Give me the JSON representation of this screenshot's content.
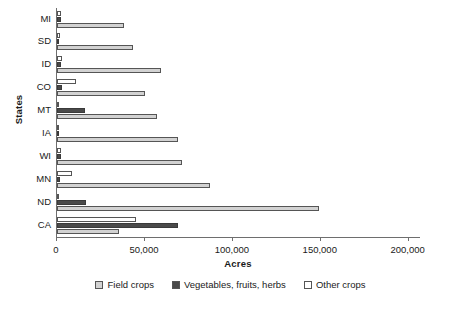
{
  "chart_data": {
    "type": "bar",
    "orientation": "horizontal",
    "title": "",
    "xlabel": "Acres",
    "ylabel": "States",
    "categories": [
      "MI",
      "SD",
      "ID",
      "CO",
      "MT",
      "IA",
      "WI",
      "MN",
      "ND",
      "CA"
    ],
    "series": [
      {
        "name": "Field crops",
        "color": "#d2d2d2",
        "values": [
          38000,
          43000,
          59000,
          50000,
          57000,
          69000,
          71000,
          87000,
          149000,
          35000
        ]
      },
      {
        "name": "Vegetables, fruits, herbs",
        "color": "#4a4a4a",
        "values": [
          2000,
          600,
          2500,
          3000,
          16000,
          600,
          2000,
          1500,
          16500,
          69000
        ]
      },
      {
        "name": "Other crops",
        "color": "#ffffff",
        "values": [
          2500,
          1800,
          3000,
          11000,
          1000,
          1200,
          2500,
          8500,
          600,
          45000
        ]
      }
    ],
    "xlim": [
      0,
      207000
    ],
    "xticks": [
      0,
      50000,
      100000,
      150000,
      200000
    ],
    "xtick_labels": [
      "0",
      "50,000",
      "100,000",
      "150,000",
      "200,000"
    ],
    "grid": false,
    "legend_position": "bottom"
  },
  "axes": {
    "y_title": "States",
    "x_title": "Acres"
  },
  "legend": {
    "items": [
      {
        "label": "Field crops",
        "color": "#d2d2d2"
      },
      {
        "label": "Vegetables, fruits, herbs",
        "color": "#4a4a4a"
      },
      {
        "label": "Other crops",
        "color": "#ffffff"
      }
    ]
  }
}
